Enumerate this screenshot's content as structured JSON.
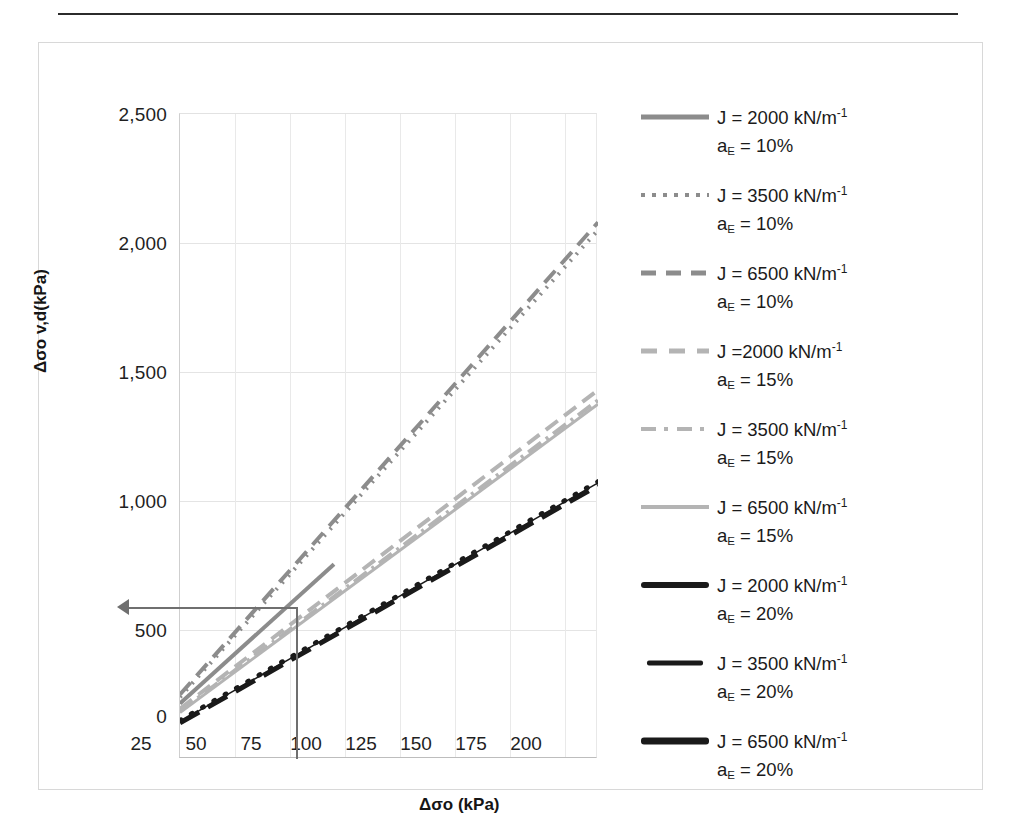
{
  "axes": {
    "x_title": "Δσo (kPa)",
    "y_title": "Δσo v,d(kPa)",
    "x_ticks": [
      "25",
      "50",
      "75",
      "100",
      "125",
      "150",
      "175",
      "200"
    ],
    "y_ticks": [
      "0",
      "500",
      "1,000",
      "1,500",
      "2,000",
      "2,500"
    ]
  },
  "legend": {
    "items": [
      {
        "j": "J = 2000 kN/m",
        "exp": "-1",
        "ae_prefix": "a",
        "ae_sub": "E",
        "ae_rest": " = 10%",
        "style": "solid-gray-thick",
        "color": "#8c8c8c"
      },
      {
        "j": "J = 3500 kN/m",
        "exp": "-1",
        "ae_prefix": "a",
        "ae_sub": "E",
        "ae_rest": " = 10%",
        "style": "dotted-gray",
        "color": "#8c8c8c"
      },
      {
        "j": "J = 6500 kN/m",
        "exp": "-1",
        "ae_prefix": "a",
        "ae_sub": "E",
        "ae_rest": " = 10%",
        "style": "dashed-gray",
        "color": "#8c8c8c"
      },
      {
        "j": "J =2000 kN/m",
        "exp": "-1",
        "ae_prefix": "a",
        "ae_sub": "E",
        "ae_rest": " = 15%",
        "style": "dashed-lightgray",
        "color": "#b4b4b4"
      },
      {
        "j": "J = 3500 kN/m",
        "exp": "-1",
        "ae_prefix": "a",
        "ae_sub": "E",
        "ae_rest": " = 15%",
        "style": "dashdot-lightgray",
        "color": "#b4b4b4"
      },
      {
        "j": "J = 6500 kN/m",
        "exp": "-1",
        "ae_prefix": "a",
        "ae_sub": "E",
        "ae_rest": " = 15%",
        "style": "solid-lightgray",
        "color": "#b4b4b4"
      },
      {
        "j": "J = 2000 kN/m",
        "exp": "-1",
        "ae_prefix": "a",
        "ae_sub": "E",
        "ae_rest": " = 20%",
        "style": "solid-black-thick",
        "color": "#1a1a1a"
      },
      {
        "j": "J = 3500 kN/m",
        "exp": "-1",
        "ae_prefix": "a",
        "ae_sub": "E",
        "ae_rest": " = 20%",
        "style": "solid-black-thin",
        "color": "#1a1a1a"
      },
      {
        "j": "J = 6500 kN/m",
        "exp": "-1",
        "ae_prefix": "a",
        "ae_sub": "E",
        "ae_rest": " = 20%",
        "style": "solid-black-double",
        "color": "#1a1a1a"
      }
    ]
  },
  "annotation": {
    "arrow_y_value": 600,
    "vline_x_value": 60
  },
  "chart_data": {
    "type": "line",
    "title": "",
    "xlabel": "Δσo (kPa)",
    "ylabel": "Δσo v,d(kPa)",
    "xlim": [
      25,
      215
    ],
    "ylim": [
      0,
      2500
    ],
    "xticks": [
      25,
      50,
      75,
      100,
      125,
      150,
      175,
      200
    ],
    "yticks": [
      0,
      500,
      1000,
      1500,
      2000,
      2500
    ],
    "grid": true,
    "legend_position": "right",
    "x": [
      25,
      215
    ],
    "series": [
      {
        "name": "J = 2000 kN/m-1, aE = 10%",
        "x": [
          25,
          95
        ],
        "values": [
          215,
          755
        ],
        "color": "#8c8c8c",
        "dash": "none",
        "width": 4
      },
      {
        "name": "J = 3500 kN/m-1, aE = 10%",
        "x": [
          25,
          215
        ],
        "values": [
          240,
          2050
        ],
        "color": "#8c8c8c",
        "dash": "2,7",
        "width": 4
      },
      {
        "name": "J = 6500 kN/m-1, aE = 10%",
        "x": [
          25,
          215
        ],
        "values": [
          250,
          2080
        ],
        "color": "#8c8c8c",
        "dash": "16,9",
        "width": 4
      },
      {
        "name": "J =2000 kN/m-1, aE = 15%",
        "x": [
          25,
          215
        ],
        "values": [
          195,
          1430
        ],
        "color": "#b4b4b4",
        "dash": "15,8",
        "width": 4
      },
      {
        "name": "J = 3500 kN/m-1, aE = 15%",
        "x": [
          25,
          215
        ],
        "values": [
          185,
          1390
        ],
        "color": "#b4b4b4",
        "dash": "16,6,3,6",
        "width": 4
      },
      {
        "name": "J = 6500 kN/m-1, aE = 15%",
        "x": [
          25,
          215
        ],
        "values": [
          180,
          1375
        ],
        "color": "#b4b4b4",
        "dash": "none",
        "width": 3
      },
      {
        "name": "J = 2000 kN/m-1, aE = 20%",
        "x": [
          25,
          215
        ],
        "values": [
          140,
          1060
        ],
        "color": "#1a1a1a",
        "dash": "22,10",
        "width": 5
      },
      {
        "name": "J = 3500 kN/m-1, aE = 20%",
        "x": [
          25,
          215
        ],
        "values": [
          145,
          1070
        ],
        "color": "#1a1a1a",
        "dash": "none",
        "width": 1.5
      },
      {
        "name": "J = 6500 kN/m-1, aE = 20%",
        "x": [
          25,
          215
        ],
        "values": [
          150,
          1075
        ],
        "color": "#1a1a1a",
        "dash": "1,12",
        "width": 5
      }
    ]
  }
}
